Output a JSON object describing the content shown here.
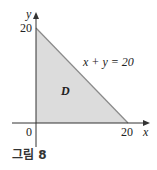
{
  "figure": {
    "caption": "그림 8",
    "region_label": "D",
    "line_label": "x + y = 20",
    "axes": {
      "x_label": "x",
      "y_label": "y",
      "origin_label": "0",
      "x_tick": "20",
      "y_tick": "20"
    },
    "colors": {
      "fill": "#dcdcdc",
      "edge": "#8a8a8a",
      "axis": "#333333"
    }
  }
}
